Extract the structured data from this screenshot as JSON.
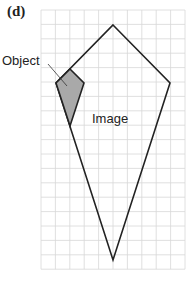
{
  "figure": {
    "part_label": "(d)",
    "object_label": "Object",
    "image_label": "Image",
    "grid": {
      "columns": 10,
      "rows": 18,
      "origin_x": 41,
      "origin_y": 10,
      "cell": 14.4,
      "line_color": "#d8d8d8"
    },
    "image_shape": {
      "points": [
        [
          113,
          25
        ],
        [
          170,
          83
        ],
        [
          113,
          260
        ],
        [
          56,
          83
        ]
      ],
      "stroke": "#222222"
    },
    "object_shape": {
      "points": [
        [
          70,
          69
        ],
        [
          84,
          83
        ],
        [
          70,
          126
        ],
        [
          56,
          83
        ]
      ],
      "fill": "#a9a9a9",
      "stroke": "#222222"
    },
    "leader_line": [
      [
        48,
        64
      ],
      [
        67,
        86
      ]
    ]
  }
}
